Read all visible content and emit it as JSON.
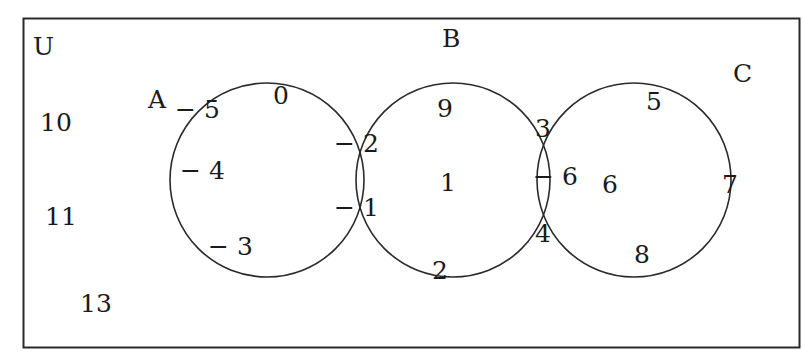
{
  "diagram": {
    "type": "venn",
    "universe_label": "U",
    "sets": [
      {
        "name": "A",
        "cx": 267,
        "cy": 180,
        "r": 97
      },
      {
        "name": "B",
        "cx": 453,
        "cy": 180,
        "r": 97
      },
      {
        "name": "C",
        "cx": 634,
        "cy": 180,
        "r": 97
      }
    ],
    "set_labels": {
      "A": {
        "text": "A",
        "x": 148,
        "y": 108
      },
      "B": {
        "text": "B",
        "x": 442,
        "y": 47
      },
      "C": {
        "text": "C",
        "x": 733,
        "y": 82
      }
    },
    "regions": {
      "U_only": [
        "10",
        "11",
        "13"
      ],
      "A_only": [
        "-5",
        "0",
        "-4",
        "-3"
      ],
      "A_and_B": [
        "-2",
        "-1"
      ],
      "B_only": [
        "9",
        "1",
        "2"
      ],
      "B_and_C": [
        "3",
        "-6",
        "4"
      ],
      "C_only": [
        "5",
        "6",
        "7",
        "8"
      ]
    },
    "elements": [
      {
        "text": "10",
        "x": 40,
        "y": 131
      },
      {
        "text": "11",
        "x": 45,
        "y": 225
      },
      {
        "text": "13",
        "x": 80,
        "y": 312
      },
      {
        "text": "− 5",
        "x": 175,
        "y": 118
      },
      {
        "text": "0",
        "x": 273,
        "y": 104
      },
      {
        "text": "− 4",
        "x": 180,
        "y": 179
      },
      {
        "text": "− 3",
        "x": 208,
        "y": 255
      },
      {
        "text": "− 2",
        "x": 334,
        "y": 152
      },
      {
        "text": "− 1",
        "x": 334,
        "y": 216
      },
      {
        "text": "9",
        "x": 437,
        "y": 117
      },
      {
        "text": "1",
        "x": 440,
        "y": 191
      },
      {
        "text": "2",
        "x": 432,
        "y": 279
      },
      {
        "text": "3",
        "x": 535,
        "y": 137
      },
      {
        "text": "− 6",
        "x": 533,
        "y": 185
      },
      {
        "text": "4",
        "x": 535,
        "y": 242
      },
      {
        "text": "6",
        "x": 602,
        "y": 193
      },
      {
        "text": "5",
        "x": 646,
        "y": 110
      },
      {
        "text": "7",
        "x": 722,
        "y": 193
      },
      {
        "text": "8",
        "x": 634,
        "y": 263
      }
    ]
  },
  "colors": {
    "stroke": "#2a2a2a",
    "text": "#1a1a1a",
    "background": "#ffffff"
  }
}
